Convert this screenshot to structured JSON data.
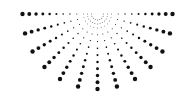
{
  "graphic": {
    "name": "radial-halftone-dots",
    "shape": "semicircle",
    "center": [
      97.5,
      14
    ],
    "outer_radius": 75,
    "rays": 13,
    "start_angle_deg": 0,
    "end_angle_deg": 180,
    "dots_per_ray": 10,
    "inner_radius": 6,
    "min_dot_radius": 0.4,
    "max_dot_radius": 2.2,
    "dot_color": "#111111",
    "background_color": "#ffffff",
    "inner_arcs": [
      {
        "radius": 6,
        "dots": 9
      },
      {
        "radius": 10,
        "dots": 13
      }
    ]
  }
}
